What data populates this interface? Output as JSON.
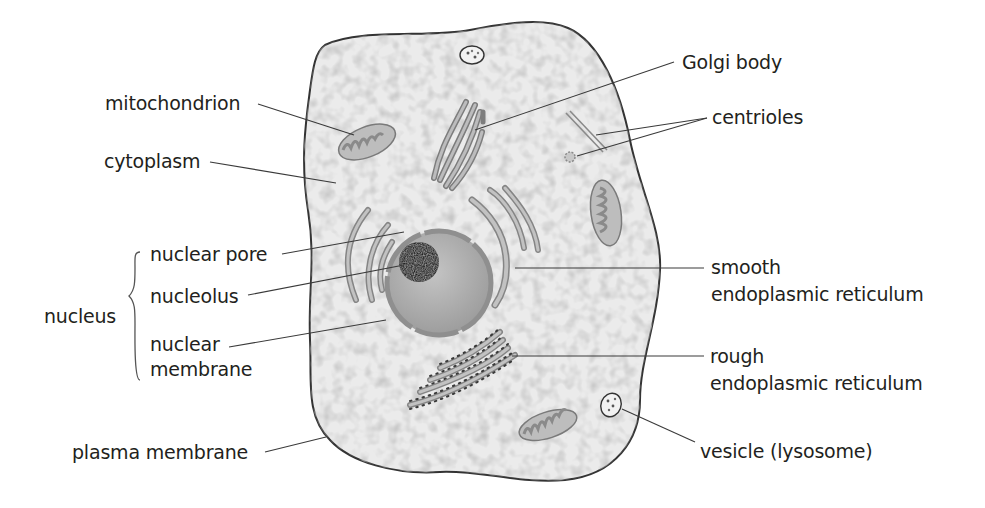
{
  "diagram": {
    "colors": {
      "background": "#ffffff",
      "cytoplasm": "#e9e9e9",
      "membrane_outline": "#333333",
      "organelle_fill": "#b5b5b5",
      "organelle_outline": "#7a7a7a",
      "nucleus_fill": "#b0b0b0",
      "nucleolus_fill": "#1e1e1e",
      "leader_line": "#3a3a3a",
      "text": "#231f20"
    },
    "labels": {
      "mitochondrion": "mitochondrion",
      "cytoplasm": "cytoplasm",
      "nucleus": "nucleus",
      "nuclear_pore": "nuclear pore",
      "nucleolus": "nucleolus",
      "nuclear_membrane_line1": "nuclear",
      "nuclear_membrane_line2": "membrane",
      "plasma_membrane": "plasma membrane",
      "golgi_body": "Golgi body",
      "centrioles": "centrioles",
      "smooth_er_line1": "smooth",
      "smooth_er_line2": "endoplasmic reticulum",
      "rough_er_line1": "rough",
      "rough_er_line2": "endoplasmic reticulum",
      "vesicle": "vesicle (lysosome)"
    }
  }
}
